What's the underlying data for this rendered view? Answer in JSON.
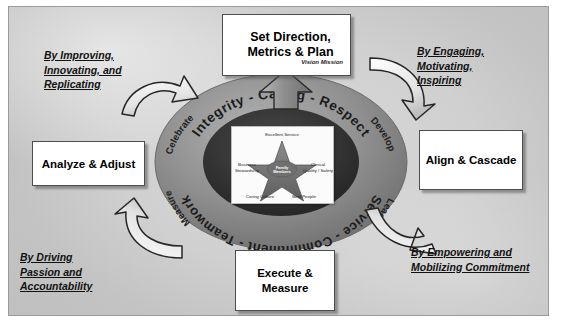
{
  "diagram": {
    "title_boxes": {
      "top": {
        "label": "Set Direction, Metrics & Plan",
        "sub1": "Vision",
        "sub2": "Mission"
      },
      "right": {
        "label": "Align & Cascade"
      },
      "bottom": {
        "label": "Execute & Measure"
      },
      "left": {
        "label": "Analyze & Adjust"
      }
    },
    "captions": {
      "top_left": {
        "line1": "By Improving,",
        "line2": "Innovating, and",
        "line3": "Replicating"
      },
      "top_right": {
        "line1": "By Engaging,",
        "line2": "Motivating,",
        "line3": "Inspiring"
      },
      "bottom_left": {
        "line1": "By Driving",
        "line2": " Passion and",
        "line3": "Accountability"
      },
      "bottom_right": {
        "line1": "By Empowering and",
        "line2": "Mobilizing Commitment"
      }
    },
    "ring": {
      "top_arc_text": "Integrity - Caring - Respect",
      "bottom_arc_text": "Service - Commitment - Teamwork",
      "verb_top_left": "Celebrate",
      "verb_top_right": "Develop",
      "verb_bottom_left": "Measure",
      "verb_bottom_right": "Lead"
    },
    "star": {
      "center_line1": "Family",
      "center_line2": "Members",
      "point_top": "Excellent Service",
      "point_left": "Business",
      "point_left2": "Stewardship",
      "point_right": "Clinical",
      "point_right2": "Quality / Safety",
      "point_bottom_left": "Caring Culture",
      "point_bottom_right": "Best People"
    },
    "colors": {
      "ring_outer": "#8e8e8e",
      "ring_inner": "#3a3a3a",
      "arrow_fill": "#f2f2f2",
      "arrow_stroke": "#2b2b2b",
      "box_border": "#4d4d4d",
      "slide_bg": "#cfcfcf"
    }
  }
}
